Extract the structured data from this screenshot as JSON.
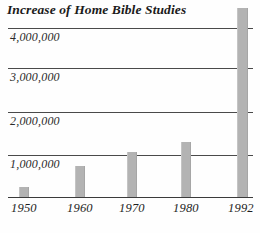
{
  "chart_data": {
    "type": "bar",
    "title": "Increase of Home Bible Studies",
    "xlabel": "",
    "ylabel": "",
    "categories": [
      "1950",
      "1960",
      "1970",
      "1980",
      "1992"
    ],
    "values": [
      230000,
      720000,
      1060000,
      1290000,
      4300000
    ],
    "ylim": [
      0,
      4500000
    ],
    "ytick_labels": [
      "4,000,000",
      "3,000,000",
      "2,000,000",
      "1,000,000"
    ],
    "ytick_values": [
      4000000,
      3000000,
      2000000,
      1000000
    ],
    "grid": true,
    "legend": null,
    "bar_color": "#b3b3b3",
    "gridline_color": "#4a4a4a",
    "axis_color": "#3b3b3b",
    "text_color": "#1b1b1b",
    "series": [
      {
        "name": "Home Bible Studies",
        "values": [
          230000,
          720000,
          1060000,
          1290000,
          4300000
        ]
      }
    ]
  },
  "yticks": [
    {
      "label": "4,000,000",
      "line_top": 28,
      "text_top": 30
    },
    {
      "label": "3,000,000",
      "line_top": 68,
      "text_top": 70
    },
    {
      "label": "2,000,000",
      "line_top": 112,
      "text_top": 114
    },
    {
      "label": "1,000,000",
      "line_top": 155,
      "text_top": 157
    }
  ],
  "bars": [
    {
      "name": "bar-1950",
      "label": "1950",
      "value": 230000,
      "left": 19,
      "width": 10,
      "top": 187,
      "height": 10,
      "tick_left": 11
    },
    {
      "name": "bar-1960",
      "label": "1960",
      "value": 720000,
      "left": 75,
      "width": 10,
      "top": 166,
      "height": 31,
      "tick_left": 67
    },
    {
      "name": "bar-1970",
      "label": "1970",
      "value": 1060000,
      "left": 127,
      "width": 10,
      "top": 152,
      "height": 45,
      "tick_left": 119
    },
    {
      "name": "bar-1980",
      "label": "1980",
      "value": 1290000,
      "left": 181,
      "width": 10,
      "top": 142,
      "height": 55,
      "tick_left": 173
    },
    {
      "name": "bar-1992",
      "label": "1992",
      "value": 4300000,
      "left": 237,
      "width": 11,
      "top": 8,
      "height": 189,
      "tick_left": 228
    }
  ]
}
